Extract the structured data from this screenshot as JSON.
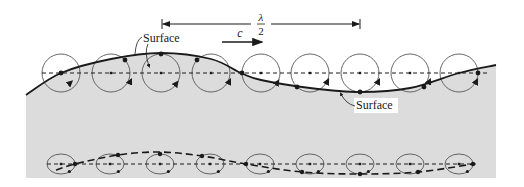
{
  "diagram": {
    "colors": {
      "water_fill": "#dcdcdc",
      "line": "#1a1a1a",
      "orbit": "#555555"
    },
    "labels": {
      "surface_top": "Surface",
      "surface_bottom": "Surface",
      "celerity": "c",
      "half_wavelength_num": "λ",
      "half_wavelength_den": "2"
    },
    "dimension_line": {
      "x1": 162,
      "x2": 360,
      "y": 24
    },
    "celerity_arrow": {
      "x1": 222,
      "x2": 262,
      "y": 42
    },
    "water_region": {
      "left": 26,
      "right": 496,
      "bottom": 178
    },
    "surface_profile": [
      [
        26,
        95
      ],
      [
        61,
        73
      ],
      [
        111,
        59
      ],
      [
        161,
        53
      ],
      [
        211,
        59
      ],
      [
        241,
        73
      ],
      [
        261,
        80
      ],
      [
        310,
        88
      ],
      [
        360,
        92
      ],
      [
        410,
        88
      ],
      [
        459,
        73
      ],
      [
        496,
        65
      ]
    ],
    "upper_orbits": {
      "y": 73,
      "r": 19,
      "particles": [
        {
          "cx": 61,
          "px": 61,
          "py": 73,
          "ax": 70,
          "ay": 83
        },
        {
          "cx": 111,
          "px": 125,
          "py": 60,
          "ax": 130,
          "ay": 82
        },
        {
          "cx": 161,
          "px": 161,
          "py": 54,
          "ax": 176,
          "ay": 84
        },
        {
          "cx": 211,
          "px": 197,
          "py": 60,
          "ax": 229,
          "ay": 82
        },
        {
          "cx": 261,
          "px": 242,
          "py": 73,
          "ax": 277,
          "ay": 83
        },
        {
          "cx": 310,
          "px": 297,
          "py": 87,
          "ax": 327,
          "ay": 82
        },
        {
          "cx": 360,
          "px": 360,
          "py": 92,
          "ax": 378,
          "ay": 82
        },
        {
          "cx": 410,
          "px": 424,
          "py": 87,
          "ax": 429,
          "ay": 82
        },
        {
          "cx": 459,
          "px": 478,
          "py": 73,
          "ax": 476,
          "ay": 82
        }
      ]
    },
    "lower_orbits": {
      "y": 164,
      "rx": 14,
      "ry": 10,
      "particles": [
        {
          "cx": 61,
          "px": 75,
          "py": 164
        },
        {
          "cx": 110,
          "px": 118,
          "py": 155
        },
        {
          "cx": 160,
          "px": 160,
          "py": 154
        },
        {
          "cx": 210,
          "px": 202,
          "py": 156
        },
        {
          "cx": 260,
          "px": 246,
          "py": 164
        },
        {
          "cx": 310,
          "px": 302,
          "py": 172
        },
        {
          "cx": 360,
          "px": 360,
          "py": 174
        },
        {
          "cx": 410,
          "px": 418,
          "py": 172
        },
        {
          "cx": 459,
          "px": 473,
          "py": 164
        }
      ]
    },
    "lower_trajectory": [
      [
        56,
        170
      ],
      [
        75,
        164
      ],
      [
        118,
        155
      ],
      [
        160,
        152
      ],
      [
        202,
        156
      ],
      [
        246,
        164
      ],
      [
        302,
        172
      ],
      [
        360,
        174
      ],
      [
        418,
        172
      ],
      [
        473,
        164
      ]
    ]
  }
}
